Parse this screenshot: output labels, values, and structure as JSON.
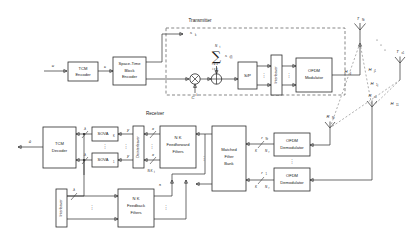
{
  "figure": {
    "type": "block-diagram"
  },
  "sections": {
    "transmitter_label": "Transmitter",
    "receiver_label": "Receiver"
  },
  "transmitter": {
    "blocks": [
      {
        "id": "tcm_encoder",
        "lines": [
          "TCM",
          "Encoder"
        ]
      },
      {
        "id": "stbc_encoder",
        "lines": [
          "Space-Time",
          "Block",
          "Encoder"
        ]
      },
      {
        "id": "sp",
        "lines": [
          "S/P"
        ]
      },
      {
        "id": "interleaver",
        "lines": [
          "Interleaver"
        ]
      },
      {
        "id": "ofdm_modulator",
        "lines": [
          "OFDM",
          "Modulator"
        ]
      }
    ],
    "operators": {
      "multiplier": "⊗",
      "adder": "⊕",
      "summation": "∑",
      "sum_upper": "N",
      "sum_upper_sub": "t",
      "sum_lower": "i = 1",
      "sum_cond": "i ≠ k",
      "sum_term": "s",
      "sum_term_sub": "i(l)"
    },
    "signals": {
      "input": "u",
      "after_tcm": "c",
      "spread_code": "C",
      "spread_code_sup": "k",
      "branch_top": "s",
      "branch_top_sub": "k",
      "sk_label": "s",
      "sk_label_sub": "k(l)"
    }
  },
  "channel": {
    "tx_antennas": [
      {
        "label": "T",
        "sub": "Nt"
      },
      {
        "label": "T",
        "sub": "x1"
      }
    ],
    "rx_antennas": [
      {
        "label": "R",
        "sub": "Nr"
      },
      {
        "label": "R",
        "sub": "x1"
      }
    ],
    "matrices": [
      {
        "label": "H",
        "sub": "jj"
      },
      {
        "label": "H",
        "sub": "j1"
      },
      {
        "label": "H",
        "sub": "1j"
      },
      {
        "label": "H",
        "sub": "11"
      }
    ],
    "dots": "⋰"
  },
  "receiver": {
    "blocks": [
      {
        "id": "tcm_decoder",
        "lines": [
          "TCM",
          "Decoder"
        ]
      },
      {
        "id": "sova_k",
        "lines": [
          "SOVA"
        ],
        "sub": "K"
      },
      {
        "id": "sova_1",
        "lines": [
          "SOVA"
        ],
        "sub": "1"
      },
      {
        "id": "deinterleaver",
        "lines": [
          "Deinterleaver"
        ]
      },
      {
        "id": "feedforward_filters",
        "lines": [
          "N K",
          "Feedforward",
          "Filters"
        ],
        "prefix_sub": "t"
      },
      {
        "id": "matched_filter_bank",
        "lines": [
          "Matched",
          "Filter",
          "Bank"
        ]
      },
      {
        "id": "ofdm_demodulator_top",
        "lines": [
          "OFDM",
          "Demodulator"
        ]
      },
      {
        "id": "ofdm_demodulator_bottom",
        "lines": [
          "OFDM",
          "Demodulator"
        ]
      },
      {
        "id": "interleaver_fb",
        "lines": [
          "Interleaver"
        ]
      },
      {
        "id": "feedback_filters",
        "lines": [
          "N K",
          "Feedback",
          "Filters"
        ],
        "prefix_sub": "t"
      }
    ],
    "signals": {
      "output": "û",
      "sova_out_k": "λ",
      "sova_out_1": "λ",
      "ff_in_k": "y",
      "ff_in_1": "y",
      "mf_out_k": "x",
      "mf_out_1": "x",
      "tap_k": "K",
      "tap_nr": "N",
      "tap_nr_sub": "r",
      "fb_in": "λ",
      "fb_out": "s̃",
      "demod_out_top": "r",
      "demod_out_bottom": "r",
      "demod_sub_top": "Nr",
      "demod_sub_bottom": "1",
      "nt_k_label": "N K",
      "nt_k_sub": "t"
    },
    "dots": "⋮"
  },
  "colors": {
    "line": "#2b2b2b",
    "dashed": "#555555",
    "channel_dashed": "#777777",
    "background": "#ffffff",
    "text": "#1a1a1a"
  }
}
